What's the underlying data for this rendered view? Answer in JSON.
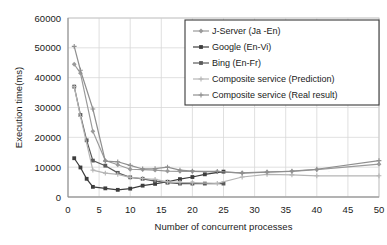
{
  "chart_data": {
    "type": "line",
    "title": "",
    "xlabel": "Number of concurrent processes",
    "ylabel": "Execution time(ms)",
    "xlim": [
      0,
      50
    ],
    "ylim": [
      0,
      60000
    ],
    "xticks": [
      0,
      5,
      10,
      15,
      20,
      25,
      30,
      35,
      40,
      45,
      50
    ],
    "yticks": [
      0,
      10000,
      20000,
      30000,
      40000,
      50000,
      60000
    ],
    "grid": true,
    "legend_position": "top-right",
    "series": [
      {
        "name": "J-Server (Ja -En)",
        "color": "#9a9a9a",
        "marker": "diamond",
        "x": [
          1,
          2,
          4,
          6,
          8,
          10,
          12,
          14,
          16,
          18,
          20,
          24,
          28,
          32,
          36,
          40,
          50
        ],
        "values": [
          44500,
          41500,
          22000,
          12200,
          10800,
          9300,
          9200,
          9000,
          8700,
          8600,
          8600,
          8400,
          8100,
          8400,
          8600,
          9200,
          11000
        ]
      },
      {
        "name": "Google (En-Vi)",
        "color": "#3d3d3d",
        "marker": "square",
        "x": [
          1,
          2,
          3,
          4,
          6,
          8,
          10,
          12,
          14,
          16,
          18,
          20,
          22,
          25
        ],
        "values": [
          13000,
          9900,
          6100,
          3400,
          2900,
          2400,
          2800,
          3800,
          4400,
          5100,
          6000,
          6700,
          7600,
          8500
        ]
      },
      {
        "name": "Bing (En-Fr)",
        "color": "#5a5a5a",
        "marker": "square",
        "x": [
          1,
          2,
          3,
          4,
          6,
          8,
          10,
          12,
          14,
          16,
          18,
          20,
          22,
          25
        ],
        "values": [
          37000,
          27500,
          19000,
          12200,
          10500,
          8100,
          6600,
          6100,
          5300,
          4800,
          4500,
          4500,
          4500,
          4500
        ]
      },
      {
        "name": "Composite service (Prediction)",
        "color": "#b5b5b5",
        "marker": "plus",
        "x": [
          1,
          2,
          4,
          6,
          8,
          10,
          12,
          14,
          16,
          18,
          20,
          24,
          28,
          32,
          36,
          40,
          50
        ],
        "values": [
          37000,
          27000,
          9000,
          8000,
          7600,
          6600,
          6200,
          5900,
          5100,
          4900,
          4800,
          4600,
          6700,
          7600,
          7400,
          7100,
          7100
        ]
      },
      {
        "name": "Composite service (Real result)",
        "color": "#8f8f8f",
        "marker": "plus",
        "x": [
          1,
          2,
          4,
          6,
          8,
          10,
          12,
          14,
          16,
          18,
          20,
          24,
          28,
          32,
          36,
          40,
          50
        ],
        "values": [
          50500,
          42500,
          29500,
          12000,
          11800,
          10600,
          9400,
          9500,
          10000,
          9000,
          8700,
          8600,
          8000,
          8300,
          8700,
          9300,
          12200
        ]
      }
    ]
  },
  "axis": {
    "y_label": "Execution time(ms)",
    "x_label": "Number of concurrent processes",
    "y_tick_labels": [
      "60000",
      "50000",
      "40000",
      "30000",
      "20000",
      "10000",
      "0"
    ],
    "x_tick_labels": [
      "0",
      "5",
      "10",
      "15",
      "20",
      "25",
      "30",
      "35",
      "40",
      "45",
      "50"
    ]
  },
  "legend": {
    "items": [
      {
        "label": "J-Server (Ja -En)"
      },
      {
        "label": "Google (En-Vi)"
      },
      {
        "label": "Bing (En-Fr)"
      },
      {
        "label": "Composite service (Prediction)"
      },
      {
        "label": "Composite service (Real result)"
      }
    ]
  }
}
